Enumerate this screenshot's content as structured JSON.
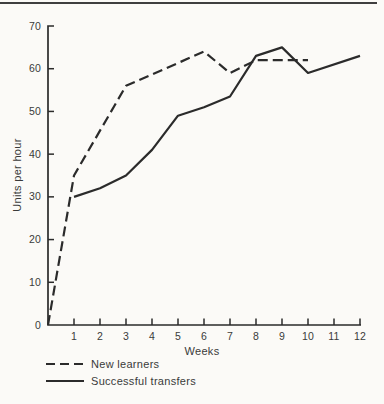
{
  "page": {
    "background": "#fbfaf7",
    "top_rule_color": "#3f3f3f",
    "ink_color": "#2b2b2b",
    "text_color": "#3a3a3a"
  },
  "chart_data": {
    "type": "line",
    "title": "",
    "xlabel": "Weeks",
    "ylabel": "Units per hour",
    "xlim": [
      0,
      12
    ],
    "ylim": [
      0,
      70
    ],
    "x_ticks": [
      1,
      2,
      3,
      4,
      5,
      6,
      7,
      8,
      9,
      10,
      11,
      12
    ],
    "y_ticks": [
      0,
      10,
      20,
      30,
      40,
      50,
      60,
      70
    ],
    "grid": false,
    "legend_position": "bottom-left",
    "series": [
      {
        "name": "New learners",
        "line_style": "dashed",
        "color": "#2b2b2b",
        "points": [
          [
            0,
            0
          ],
          [
            1,
            35
          ],
          [
            3,
            56
          ],
          [
            6,
            64
          ],
          [
            7,
            59
          ],
          [
            8,
            62
          ],
          [
            10,
            62
          ]
        ]
      },
      {
        "name": "Successful transfers",
        "line_style": "solid",
        "color": "#2b2b2b",
        "points": [
          [
            1,
            30
          ],
          [
            2,
            32
          ],
          [
            3,
            35
          ],
          [
            4,
            41
          ],
          [
            5,
            49
          ],
          [
            6,
            51
          ],
          [
            7,
            53.5
          ],
          [
            8,
            63
          ],
          [
            9,
            65
          ],
          [
            10,
            59
          ],
          [
            12,
            63
          ]
        ]
      }
    ]
  }
}
